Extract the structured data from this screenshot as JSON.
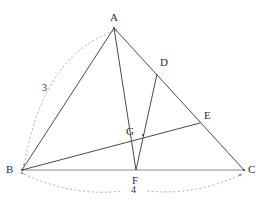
{
  "figure": {
    "title_fragment": "",
    "canvas": {
      "width": 260,
      "height": 203,
      "background": "#ffffff"
    },
    "colors": {
      "solid_line": "#4a4a4a",
      "dashed_line": "#9a9a9a",
      "label_text": "#2e2e2e",
      "baseline": "#6b6b6b"
    },
    "vertices": [
      {
        "id": "A",
        "label": "A",
        "x": 114,
        "y": 28,
        "label_x": 111,
        "label_y": 12
      },
      {
        "id": "B",
        "label": "B",
        "x": 22,
        "y": 170,
        "label_x": 7,
        "label_y": 165
      },
      {
        "id": "C",
        "label": "C",
        "x": 244,
        "y": 170,
        "label_x": 248,
        "label_y": 165
      },
      {
        "id": "D",
        "label": "D",
        "x": 157,
        "y": 74,
        "label_x": 160,
        "label_y": 57
      },
      {
        "id": "E",
        "label": "E",
        "x": 200,
        "y": 123,
        "label_x": 204,
        "label_y": 110
      },
      {
        "id": "F",
        "label": "F",
        "x": 136,
        "y": 170,
        "label_x": 133,
        "label_y": 175
      },
      {
        "id": "G",
        "label": "G",
        "x": 143,
        "y": 135,
        "label_x": 126,
        "label_y": 126
      }
    ],
    "segments": [
      {
        "name": "segment-AB",
        "from": "A",
        "to": "B",
        "style": "solid"
      },
      {
        "name": "segment-AC",
        "from": "A",
        "to": "C",
        "style": "solid"
      },
      {
        "name": "segment-AF",
        "from": "A",
        "to": "F",
        "style": "solid"
      },
      {
        "name": "segment-DF",
        "from": "D",
        "to": "F",
        "style": "solid"
      },
      {
        "name": "segment-BE",
        "from": "B",
        "to": "E",
        "style": "solid"
      },
      {
        "name": "segment-BC",
        "from": "B",
        "to": "C",
        "style": "baseline"
      }
    ],
    "measure_arcs": [
      {
        "name": "measure-arc-AB",
        "label": "3",
        "label_x": 42,
        "label_y": 83,
        "path": "M 114 30 Q 40 58 23 168",
        "style": "dashed"
      },
      {
        "name": "measure-arc-BC-left",
        "label": "",
        "path": "M 23 174 Q 75 196 123 191",
        "style": "dashed"
      },
      {
        "name": "measure-arc-BC-right",
        "label": "",
        "path": "M 146 191 Q 196 196 243 174",
        "style": "dashed"
      }
    ],
    "measure_labels": [
      {
        "name": "measure-label-3",
        "text": "3",
        "x": 42,
        "y": 83
      },
      {
        "name": "measure-label-4",
        "text": "4",
        "x": 131,
        "y": 185
      }
    ],
    "arrow_markers": [
      {
        "name": "arrow-at-B-top",
        "at": "B"
      },
      {
        "name": "arrow-at-B-bottom",
        "at": "B"
      },
      {
        "name": "arrow-at-C",
        "at": "C"
      },
      {
        "name": "arrow-at-A",
        "at": "A"
      }
    ]
  }
}
